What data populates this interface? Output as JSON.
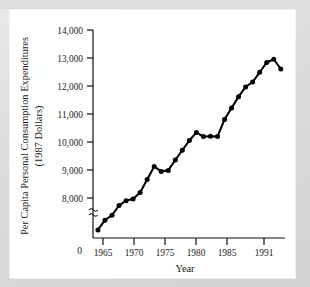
{
  "figure": {
    "panel_background": "#ffffff",
    "frame_background": "#d8d8d8",
    "series_color": "#000000"
  },
  "chart_data": {
    "type": "line",
    "title": "",
    "xlabel": "Year",
    "ylabel": "Per Capita Personal Consumption Expenditures (1987 Dollars)",
    "ylabel_line1": "Per Capita Personal Consumption Expenditures",
    "ylabel_line2": "(1987 Dollars)",
    "origin_label": "0",
    "xlim": [
      1964.3,
      1991.6
    ],
    "ylim": [
      7600,
      14000
    ],
    "y_axis_break": true,
    "grid": false,
    "legend": false,
    "markers": "filled-circle",
    "xticks": [
      1965,
      1970,
      1975,
      1980,
      1985,
      1991
    ],
    "xticklabels": [
      "1965",
      "1970",
      "1975",
      "1980",
      "1985",
      "1991"
    ],
    "yticks": [
      8000,
      9000,
      10000,
      11000,
      12000,
      13000,
      14000
    ],
    "yticklabels": [
      "8,000",
      "9,000",
      "10,000",
      "11,000",
      "12,000",
      "13,000",
      "14,000"
    ],
    "x": [
      1965,
      1966,
      1967,
      1968,
      1969,
      1970,
      1971,
      1972,
      1973,
      1974,
      1975,
      1976,
      1977,
      1978,
      1979,
      1980,
      1981,
      1982,
      1983,
      1984,
      1985,
      1986,
      1987,
      1988,
      1989,
      1990,
      1991
    ],
    "values": [
      7850,
      8150,
      8300,
      8600,
      8750,
      8800,
      9000,
      9400,
      9800,
      9650,
      9680,
      10000,
      10300,
      10600,
      10850,
      10720,
      10730,
      10720,
      11250,
      11600,
      11950,
      12250,
      12400,
      12700,
      13000,
      13100,
      12800
    ],
    "series": [
      {
        "name": "Per Capita Personal Consumption Expenditures",
        "values": [
          7850,
          8150,
          8300,
          8600,
          8750,
          8800,
          9000,
          9400,
          9800,
          9650,
          9680,
          10000,
          10300,
          10600,
          10850,
          10720,
          10730,
          10720,
          11250,
          11600,
          11950,
          12250,
          12400,
          12700,
          13000,
          13100,
          12800
        ]
      }
    ]
  }
}
